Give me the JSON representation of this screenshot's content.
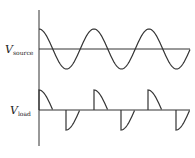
{
  "diagram": {
    "type": "waveform",
    "labels": {
      "source": {
        "main": "V",
        "sub": "source"
      },
      "load": {
        "main": "V",
        "sub": "load"
      }
    },
    "colors": {
      "stroke": "#333333",
      "text": "#222222",
      "background": "#ffffff"
    },
    "axis": {
      "x": 39,
      "top": 10,
      "bottom": 146
    },
    "source_wave": {
      "baseline_y": 49,
      "amplitude": 20,
      "period": 55,
      "start_x": 39,
      "end_x": 190,
      "cycles": 2.75
    },
    "load_wave": {
      "baseline_y": 110,
      "amplitude": 20,
      "positive_pulses_start_x": [
        39,
        94,
        148
      ],
      "negative_pulses_start_x": [
        66,
        121,
        176
      ],
      "baseline_end_x": 190
    }
  }
}
